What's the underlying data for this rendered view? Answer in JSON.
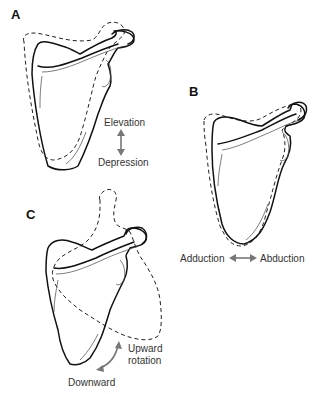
{
  "figure": {
    "panels": [
      {
        "id": "A",
        "letter": "A",
        "motion_labels": [
          "Elevation",
          "Depression"
        ],
        "arrow": "vertical-double"
      },
      {
        "id": "B",
        "letter": "B",
        "motion_labels": [
          "Adduction",
          "Abduction"
        ],
        "arrow": "horizontal-double"
      },
      {
        "id": "C",
        "letter": "C",
        "motion_labels": [
          "Upward",
          "rotation",
          "Downward"
        ],
        "arrow": "curved-double"
      }
    ],
    "legend": {
      "solid_outline": "resting position",
      "dashed_outline": "moved position"
    },
    "colors": {
      "line": "#111111",
      "arrow": "#777777",
      "text": "#333333",
      "background": "#ffffff"
    }
  }
}
